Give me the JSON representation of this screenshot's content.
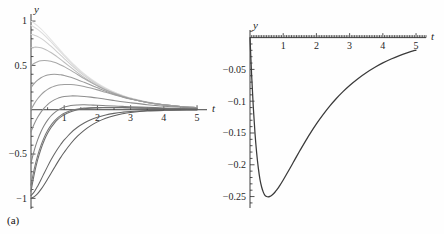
{
  "figure": {
    "background": "#fefefe",
    "panels": [
      {
        "id": "a",
        "caption": "(a)"
      },
      {
        "id": "b",
        "caption": "(b)"
      }
    ]
  },
  "chart_data": [
    {
      "type": "line",
      "panel": "(a)",
      "title": "",
      "xlabel": "t",
      "ylabel": "y",
      "xlim": [
        0,
        5.3
      ],
      "ylim": [
        -1.12,
        1.08
      ],
      "grid": false,
      "legend": null,
      "xticks": [
        1,
        2,
        3,
        4,
        5
      ],
      "xticklabels": [
        "1",
        "2",
        "3",
        "4",
        "5"
      ],
      "yticks": [
        -1,
        -0.5,
        0.5,
        1
      ],
      "yticklabels": [
        "−1",
        "−0.5",
        "0.5",
        "1"
      ],
      "minor_tick_step": 0.1,
      "x": [
        0,
        0.1,
        0.2,
        0.3,
        0.4,
        0.5,
        0.6,
        0.7,
        0.8,
        0.9,
        1.0,
        1.2,
        1.4,
        1.6,
        1.8,
        2.0,
        2.25,
        2.5,
        2.75,
        3.0,
        3.5,
        4.0,
        4.5,
        5.0
      ],
      "series": [
        {
          "name": "y0 = 1.00",
          "color": "#e4e4e4",
          "values": [
            1.0,
            0.976,
            0.946,
            0.912,
            0.874,
            0.834,
            0.792,
            0.749,
            0.706,
            0.664,
            0.622,
            0.543,
            0.471,
            0.406,
            0.349,
            0.299,
            0.245,
            0.2,
            0.163,
            0.133,
            0.0875,
            0.0573,
            0.0374,
            0.0244
          ]
        },
        {
          "name": "y0 = 0.95",
          "color": "#dcdcdc",
          "values": [
            0.95,
            0.931,
            0.906,
            0.876,
            0.842,
            0.806,
            0.767,
            0.727,
            0.687,
            0.647,
            0.607,
            0.531,
            0.461,
            0.398,
            0.343,
            0.294,
            0.241,
            0.197,
            0.161,
            0.131,
            0.0863,
            0.0566,
            0.037,
            0.0241
          ]
        },
        {
          "name": "y0 = 0.85",
          "color": "#cfcfcf",
          "values": [
            0.85,
            0.841,
            0.826,
            0.805,
            0.779,
            0.749,
            0.717,
            0.683,
            0.648,
            0.612,
            0.577,
            0.508,
            0.443,
            0.384,
            0.332,
            0.285,
            0.234,
            0.192,
            0.157,
            0.128,
            0.0844,
            0.0554,
            0.0362,
            0.0236
          ]
        },
        {
          "name": "y0 = 0.70",
          "color": "#bdbdbd",
          "values": [
            0.7,
            0.706,
            0.705,
            0.698,
            0.685,
            0.667,
            0.645,
            0.62,
            0.593,
            0.565,
            0.536,
            0.477,
            0.419,
            0.365,
            0.316,
            0.272,
            0.224,
            0.184,
            0.151,
            0.123,
            0.0813,
            0.0534,
            0.0349,
            0.0228
          ]
        },
        {
          "name": "y0 = 0.50",
          "color": "#a8a8a8",
          "values": [
            0.5,
            0.525,
            0.542,
            0.552,
            0.555,
            0.553,
            0.546,
            0.535,
            0.521,
            0.504,
            0.486,
            0.444,
            0.398,
            0.352,
            0.309,
            0.269,
            0.223,
            0.185,
            0.152,
            0.125,
            0.0831,
            0.0548,
            0.0359,
            0.0235
          ]
        },
        {
          "name": "y0 = 0.25",
          "color": "#9a9a9a",
          "values": [
            0.25,
            0.297,
            0.333,
            0.36,
            0.379,
            0.391,
            0.398,
            0.4,
            0.398,
            0.394,
            0.387,
            0.366,
            0.339,
            0.309,
            0.278,
            0.247,
            0.209,
            0.176,
            0.147,
            0.122,
            0.0824,
            0.0548,
            0.0362,
            0.0238
          ]
        },
        {
          "name": "y0 = 0.00",
          "color": "#9e9e9e",
          "values": [
            0.0,
            0.069,
            0.124,
            0.168,
            0.203,
            0.23,
            0.25,
            0.265,
            0.275,
            0.281,
            0.285,
            0.284,
            0.276,
            0.262,
            0.244,
            0.224,
            0.196,
            0.169,
            0.143,
            0.12,
            0.0826,
            0.0557,
            0.0371,
            0.0245
          ]
        },
        {
          "name": "y0 = -0.25",
          "color": "#8e8e8e",
          "values": [
            -0.25,
            -0.159,
            -0.086,
            -0.027,
            0.02,
            0.058,
            0.088,
            0.111,
            0.128,
            0.14,
            0.149,
            0.156,
            0.155,
            0.15,
            0.142,
            0.132,
            0.118,
            0.104,
            0.09,
            0.078,
            0.0565,
            0.0397,
            0.0273,
            0.0185
          ]
        },
        {
          "name": "y0 = -0.60",
          "color": "#828282",
          "values": [
            -0.6,
            -0.455,
            -0.34,
            -0.248,
            -0.175,
            -0.117,
            -0.071,
            -0.035,
            -0.007,
            0.014,
            0.03,
            0.048,
            0.054,
            0.055,
            0.053,
            0.05,
            0.046,
            0.042,
            0.038,
            0.034,
            0.0269,
            0.02,
            0.0145,
            0.0102
          ]
        },
        {
          "name": "y0 = -0.85",
          "color": "#787878",
          "values": [
            -0.85,
            -0.665,
            -0.518,
            -0.402,
            -0.309,
            -0.235,
            -0.176,
            -0.129,
            -0.092,
            -0.063,
            -0.04,
            -0.01,
            0.008,
            0.018,
            0.023,
            0.025,
            0.026,
            0.025,
            0.024,
            0.022,
            0.0182,
            0.014,
            0.0104,
            0.0075
          ]
        },
        {
          "name": "y0 = -0.92",
          "color": "#6e6e6e",
          "values": [
            -0.92,
            -0.723,
            -0.567,
            -0.443,
            -0.344,
            -0.266,
            -0.203,
            -0.153,
            -0.113,
            -0.081,
            -0.056,
            -0.022,
            -0.001,
            0.011,
            0.018,
            0.021,
            0.022,
            0.023,
            0.022,
            0.02,
            0.017,
            0.0132,
            0.0099,
            0.0072
          ]
        },
        {
          "name": "y0 = -0.97",
          "color": "#666666",
          "values": [
            -0.97,
            -0.926,
            -0.862,
            -0.789,
            -0.713,
            -0.639,
            -0.568,
            -0.503,
            -0.443,
            -0.389,
            -0.341,
            -0.26,
            -0.198,
            -0.15,
            -0.113,
            -0.086,
            -0.059,
            -0.041,
            -0.028,
            -0.019,
            -0.0088,
            -0.004,
            -0.0018,
            -0.0008
          ]
        },
        {
          "name": "y0 = -1.00",
          "color": "#5f5f5f",
          "values": [
            -1.0,
            -0.981,
            -0.946,
            -0.899,
            -0.843,
            -0.782,
            -0.719,
            -0.656,
            -0.594,
            -0.535,
            -0.48,
            -0.381,
            -0.299,
            -0.232,
            -0.179,
            -0.137,
            -0.096,
            -0.067,
            -0.046,
            -0.032,
            -0.015,
            -0.007,
            -0.0032,
            -0.0015
          ]
        }
      ]
    },
    {
      "type": "line",
      "panel": "(b)",
      "title": "",
      "xlabel": "t",
      "ylabel": "y",
      "xlim": [
        0,
        5.3
      ],
      "ylim": [
        -0.268,
        0.012
      ],
      "grid": false,
      "legend": null,
      "xticks": [
        1,
        2,
        3,
        4,
        5
      ],
      "xticklabels": [
        "1",
        "2",
        "3",
        "4",
        "5"
      ],
      "yticks": [
        -0.25,
        -0.2,
        -0.15,
        -0.1,
        -0.05
      ],
      "yticklabels": [
        "−0.25",
        "−0.2",
        "−0.15",
        "−0.1",
        "−0.05"
      ],
      "minor_tick_step": 0.01,
      "color": "#3a3a3a",
      "x": [
        0,
        0.05,
        0.1,
        0.15,
        0.2,
        0.25,
        0.3,
        0.35,
        0.4,
        0.45,
        0.5,
        0.55,
        0.6,
        0.65,
        0.7,
        0.75,
        0.8,
        0.85,
        0.9,
        1.0,
        1.1,
        1.2,
        1.3,
        1.4,
        1.5,
        1.6,
        1.8,
        2.0,
        2.2,
        2.4,
        2.6,
        2.8,
        3.0,
        3.25,
        3.5,
        3.75,
        4.0,
        4.25,
        4.5,
        4.75,
        5.0
      ],
      "values": [
        0.0,
        -0.06,
        -0.11,
        -0.15,
        -0.181,
        -0.205,
        -0.223,
        -0.235,
        -0.243,
        -0.248,
        -0.25,
        -0.2505,
        -0.2497,
        -0.2482,
        -0.246,
        -0.2432,
        -0.24,
        -0.2364,
        -0.2325,
        -0.224,
        -0.215,
        -0.2058,
        -0.1965,
        -0.1872,
        -0.178,
        -0.169,
        -0.1518,
        -0.1358,
        -0.1212,
        -0.1078,
        -0.0958,
        -0.085,
        -0.0752,
        -0.0645,
        -0.0552,
        -0.047,
        -0.0398,
        -0.0336,
        -0.0282,
        -0.0236,
        -0.0196
      ],
      "minimum": {
        "t": 0.55,
        "y": -0.25
      }
    }
  ]
}
